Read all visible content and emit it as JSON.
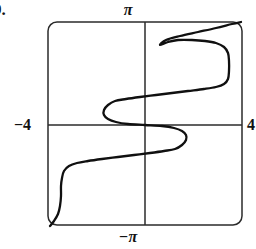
{
  "figure": {
    "problem_number": "9.",
    "caption": ""
  },
  "axes": {
    "top_label": "π",
    "bottom_label": "−π",
    "left_label": "−4",
    "right_label": "4",
    "origin_px": {
      "x": 145,
      "y": 125
    },
    "frame_px": {
      "left": 48,
      "top": 22,
      "right": 242,
      "bottom": 225
    },
    "corner_radius_px": 9,
    "stroke_color": "#2b2b2b"
  },
  "chart_data": {
    "type": "line",
    "title": "",
    "subtitle": "",
    "xlabel": "",
    "ylabel": "",
    "xlim": [
      -4,
      4
    ],
    "ylim": [
      -3.14159,
      3.14159
    ],
    "xticks": [
      -4,
      4
    ],
    "xticklabels": [
      "−4",
      "4"
    ],
    "yticks": [
      -3.14159,
      3.14159
    ],
    "yticklabels": [
      "−π",
      "π"
    ],
    "grid": false,
    "legend": null,
    "annotations": [],
    "orientation": "x-as-function-of-y",
    "series": [
      {
        "name": "curve",
        "color": "#101010",
        "line_width": 2.3,
        "points_px": [
          {
            "x": 50,
            "y": 226
          },
          {
            "x": 54,
            "y": 221
          },
          {
            "x": 58,
            "y": 214
          },
          {
            "x": 60,
            "y": 206
          },
          {
            "x": 61,
            "y": 196
          },
          {
            "x": 61,
            "y": 186
          },
          {
            "x": 62,
            "y": 178
          },
          {
            "x": 64,
            "y": 171
          },
          {
            "x": 69,
            "y": 166
          },
          {
            "x": 77,
            "y": 163
          },
          {
            "x": 88,
            "y": 161
          },
          {
            "x": 102,
            "y": 159
          },
          {
            "x": 118,
            "y": 157
          },
          {
            "x": 134,
            "y": 155
          },
          {
            "x": 150,
            "y": 153
          },
          {
            "x": 164,
            "y": 151
          },
          {
            "x": 175,
            "y": 149
          },
          {
            "x": 182,
            "y": 145
          },
          {
            "x": 186,
            "y": 140
          },
          {
            "x": 186,
            "y": 135
          },
          {
            "x": 182,
            "y": 131
          },
          {
            "x": 174,
            "y": 128
          },
          {
            "x": 162,
            "y": 126
          },
          {
            "x": 145,
            "y": 125
          },
          {
            "x": 128,
            "y": 124
          },
          {
            "x": 116,
            "y": 122
          },
          {
            "x": 108,
            "y": 119
          },
          {
            "x": 104,
            "y": 115
          },
          {
            "x": 104,
            "y": 110
          },
          {
            "x": 108,
            "y": 105
          },
          {
            "x": 115,
            "y": 101
          },
          {
            "x": 126,
            "y": 99
          },
          {
            "x": 140,
            "y": 97
          },
          {
            "x": 156,
            "y": 95
          },
          {
            "x": 172,
            "y": 93
          },
          {
            "x": 188,
            "y": 91
          },
          {
            "x": 204,
            "y": 89
          },
          {
            "x": 216,
            "y": 87
          },
          {
            "x": 224,
            "y": 84
          },
          {
            "x": 228,
            "y": 79
          },
          {
            "x": 229,
            "y": 71
          },
          {
            "x": 229,
            "y": 61
          },
          {
            "x": 228,
            "y": 53
          },
          {
            "x": 224,
            "y": 47
          },
          {
            "x": 216,
            "y": 43
          },
          {
            "x": 205,
            "y": 41
          },
          {
            "x": 192,
            "y": 40
          },
          {
            "x": 178,
            "y": 40
          },
          {
            "x": 168,
            "y": 42
          },
          {
            "x": 160,
            "y": 45
          },
          {
            "x": 166,
            "y": 40
          },
          {
            "x": 180,
            "y": 36
          },
          {
            "x": 198,
            "y": 32
          },
          {
            "x": 216,
            "y": 28
          },
          {
            "x": 232,
            "y": 24
          },
          {
            "x": 241,
            "y": 22
          }
        ]
      }
    ]
  }
}
